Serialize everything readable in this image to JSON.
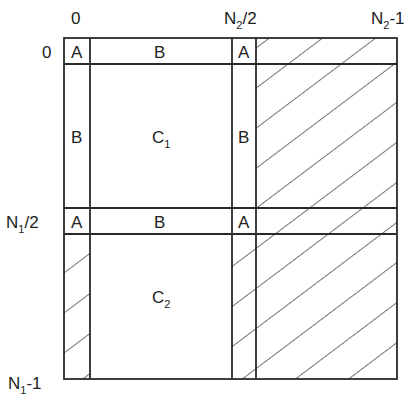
{
  "axis_labels": {
    "top": {
      "col0": "0",
      "col_mid": "N",
      "col_mid_sub": "2",
      "col_mid_suffix": "/2",
      "col_end": "N",
      "col_end_sub": "2",
      "col_end_suffix": "-1"
    },
    "left": {
      "row0": "0",
      "row_mid": "N",
      "row_mid_sub": "1",
      "row_mid_suffix": "/2",
      "row_end": "N",
      "row_end_sub": "1",
      "row_end_suffix": "-1"
    }
  },
  "cells": {
    "top_row": {
      "a_left": "A",
      "b": "B",
      "a_right": "A"
    },
    "top_block": {
      "b_left": "B",
      "c": "C",
      "c_sub": "1",
      "b_right": "B"
    },
    "mid_row": {
      "a_left": "A",
      "b": "B",
      "a_right": "A"
    },
    "bottom_block": {
      "c": "C",
      "c_sub": "2"
    }
  },
  "colors": {
    "line": "#2a2a2a",
    "background": "#ffffff"
  }
}
